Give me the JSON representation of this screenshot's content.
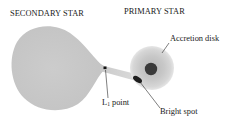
{
  "diagram": {
    "headings": {
      "secondary": "SECONDARY STAR",
      "primary": "PRIMARY STAR"
    },
    "labels": {
      "accretion_disk": "Accretion disk",
      "l1_prefix": "L",
      "l1_subscript": "1",
      "l1_suffix": " point",
      "bright_spot": "Bright spot"
    },
    "colors": {
      "secondary_star": "#c9c9c9",
      "stream": "#cfcfcf",
      "accretion_disk_outer": "#d4d4d4",
      "accretion_disk_inner": "#bdbdbd",
      "primary_star": "#3a3a3a",
      "bright_spot": "#1e1e1e",
      "l1_dot": "#111111",
      "leader_lines": "#2a2a2a"
    }
  }
}
